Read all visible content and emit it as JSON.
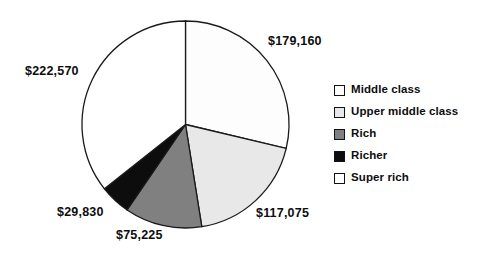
{
  "chart_data": {
    "type": "pie",
    "title": "",
    "subtitle": "",
    "xlabel": "",
    "ylabel": "",
    "grid": false,
    "legend_position": "right",
    "start_angle_deg": 0,
    "direction": "clockwise",
    "categories": [
      "Middle class",
      "Upper middle class",
      "Rich",
      "Richer",
      "Super rich"
    ],
    "values": [
      179160,
      117075,
      75225,
      29830,
      222570
    ],
    "data_labels": [
      "$179,160",
      "$117,075",
      "$75,225",
      "$29,830",
      "$222,570"
    ],
    "slice_colors": [
      "#fdfdfd",
      "#e8e8e8",
      "#808080",
      "#0d0d0d",
      "#ffffff"
    ],
    "total": 623860,
    "slices": [
      {
        "label": "Middle class",
        "value": 179160,
        "value_label": "$179,160",
        "color": "#fdfdfd",
        "percent": 28.7
      },
      {
        "label": "Upper middle class",
        "value": 117075,
        "value_label": "$117,075",
        "color": "#e8e8e8",
        "percent": 18.8
      },
      {
        "label": "Rich",
        "value": 75225,
        "value_label": "$75,225",
        "color": "#808080",
        "percent": 12.1
      },
      {
        "label": "Richer",
        "value": 29830,
        "value_label": "$29,830",
        "color": "#0d0d0d",
        "percent": 4.8
      },
      {
        "label": "Super rich",
        "value": 222570,
        "value_label": "$222,570",
        "color": "#ffffff",
        "percent": 35.7
      }
    ]
  },
  "legend": {
    "items": [
      {
        "label": "Middle class",
        "color": "#fdfdfd"
      },
      {
        "label": "Upper middle class",
        "color": "#e8e8e8"
      },
      {
        "label": "Rich",
        "color": "#808080"
      },
      {
        "label": "Richer",
        "color": "#0d0d0d"
      },
      {
        "label": "Super rich",
        "color": "#ffffff"
      }
    ]
  },
  "labels": {
    "middle_class": "$179,160",
    "upper_middle_class": "$117,075",
    "rich": "$75,225",
    "richer": "$29,830",
    "super_rich": "$222,570"
  },
  "colors": {
    "outline": "#1a1a1a",
    "text": "#0d0d0d",
    "background": "#ffffff"
  }
}
